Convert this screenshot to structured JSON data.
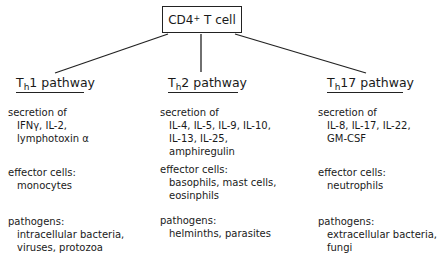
{
  "root": {
    "label_main": "CD4",
    "label_sup": "+",
    "label_rest": " T cell"
  },
  "pathways": [
    {
      "name_prefix": "T",
      "name_sub": "h",
      "name_suffix": "1 pathway",
      "secretion_label": "secretion of",
      "secretion": [
        "IFNγ, IL-2,",
        "lymphotoxin α"
      ],
      "effector_label": "effector cells:",
      "effector": [
        "monocytes"
      ],
      "pathogens_label": "pathogens:",
      "pathogens": [
        "intracellular bacteria,",
        "viruses, protozoa"
      ]
    },
    {
      "name_prefix": "T",
      "name_sub": "h",
      "name_suffix": "2 pathway",
      "secretion_label": "secretion of",
      "secretion": [
        "IL-4, IL-5, IL-9, IL-10,",
        "IL-13, IL-25,",
        "amphiregulin"
      ],
      "effector_label": "effector cells:",
      "effector": [
        "basophils, mast cells,",
        "eosinphils"
      ],
      "pathogens_label": "pathogens:",
      "pathogens": [
        "helminths, parasites"
      ]
    },
    {
      "name_prefix": "T",
      "name_sub": "h",
      "name_suffix": "17 pathway",
      "secretion_label": "secretion of",
      "secretion": [
        "IL-8, IL-17, IL-22,",
        "GM-CSF"
      ],
      "effector_label": "effector cells:",
      "effector": [
        "neutrophils"
      ],
      "pathogens_label": "pathogens:",
      "pathogens": [
        "extracellular bacteria,",
        "fungi"
      ]
    }
  ]
}
